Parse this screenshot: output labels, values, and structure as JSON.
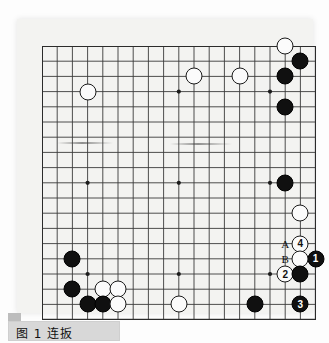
{
  "figure": {
    "caption_label": "图 1",
    "caption_title": "连扳",
    "caption_full": "图 1  连扳"
  },
  "board": {
    "type": "go-board",
    "size": 19,
    "origin_x": 25,
    "origin_y": 27,
    "spacing": 15.2,
    "line_color": "#3a3a3a",
    "border_color": "#2b2b2b",
    "background_color": "#f3f3f1",
    "star_points": [
      {
        "col": 3,
        "row": 3
      },
      {
        "col": 9,
        "row": 3
      },
      {
        "col": 15,
        "row": 3
      },
      {
        "col": 3,
        "row": 9
      },
      {
        "col": 9,
        "row": 9
      },
      {
        "col": 15,
        "row": 9
      },
      {
        "col": 3,
        "row": 15
      },
      {
        "col": 9,
        "row": 15
      },
      {
        "col": 15,
        "row": 15
      }
    ],
    "stones": [
      {
        "color": "white",
        "col": 16,
        "row": 0,
        "label": ""
      },
      {
        "color": "black",
        "col": 17,
        "row": 1,
        "label": ""
      },
      {
        "color": "white",
        "col": 10,
        "row": 2,
        "label": ""
      },
      {
        "color": "white",
        "col": 13,
        "row": 2,
        "label": ""
      },
      {
        "color": "black",
        "col": 16,
        "row": 2,
        "label": ""
      },
      {
        "color": "white",
        "col": 3,
        "row": 3,
        "label": ""
      },
      {
        "color": "black",
        "col": 16,
        "row": 4,
        "label": ""
      },
      {
        "color": "black",
        "col": 16,
        "row": 9,
        "label": ""
      },
      {
        "color": "white",
        "col": 17,
        "row": 11,
        "label": ""
      },
      {
        "color": "black",
        "col": 2,
        "row": 14,
        "label": ""
      },
      {
        "color": "white",
        "col": 17,
        "row": 13,
        "label": "4"
      },
      {
        "color": "black",
        "col": 18,
        "row": 14,
        "label": "1"
      },
      {
        "color": "white",
        "col": 17,
        "row": 14,
        "label": ""
      },
      {
        "color": "black",
        "col": 2,
        "row": 16,
        "label": ""
      },
      {
        "color": "white",
        "col": 4,
        "row": 16,
        "label": ""
      },
      {
        "color": "white",
        "col": 5,
        "row": 16,
        "label": ""
      },
      {
        "color": "white",
        "col": 16,
        "row": 15,
        "label": "2"
      },
      {
        "color": "black",
        "col": 17,
        "row": 15,
        "label": ""
      },
      {
        "color": "black",
        "col": 3,
        "row": 17,
        "label": ""
      },
      {
        "color": "black",
        "col": 4,
        "row": 17,
        "label": ""
      },
      {
        "color": "white",
        "col": 5,
        "row": 17,
        "label": ""
      },
      {
        "color": "white",
        "col": 9,
        "row": 17,
        "label": ""
      },
      {
        "color": "black",
        "col": 14,
        "row": 17,
        "label": ""
      },
      {
        "color": "black",
        "col": 17,
        "row": 17,
        "label": "3"
      }
    ],
    "point_labels": [
      {
        "text": "A",
        "col": 16,
        "row": 13
      },
      {
        "text": "B",
        "col": 16,
        "row": 14
      }
    ],
    "move_numbers": {
      "move_1": "1",
      "move_2": "2",
      "move_3": "3",
      "move_4": "4"
    }
  },
  "artifacts": [
    {
      "x": 40,
      "y": 123,
      "width": 56
    },
    {
      "x": 153,
      "y": 124,
      "width": 62
    }
  ]
}
